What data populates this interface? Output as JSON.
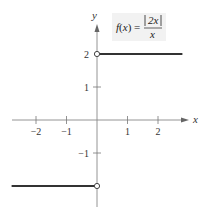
{
  "chart_data": {
    "type": "line",
    "function_label": {
      "lhs": "f(x) =",
      "numerator": "2x",
      "denominator": "x"
    },
    "xlabel": "x",
    "ylabel": "y",
    "xlim": [
      -2.8,
      2.9
    ],
    "ylim": [
      -2.6,
      3.1
    ],
    "x_ticks": [
      -2,
      -1,
      1,
      2
    ],
    "y_ticks": [
      -1,
      1,
      2
    ],
    "x_tick_labels": [
      "−2",
      "−1",
      "1",
      "2"
    ],
    "y_tick_labels": [
      "−1",
      "1",
      "2"
    ],
    "grid": false,
    "series": [
      {
        "name": "f(x) for x > 0",
        "x": [
          0,
          2.8
        ],
        "y": [
          2,
          2
        ],
        "left_endpoint": "open"
      },
      {
        "name": "f(x) for x < 0",
        "x": [
          -2.8,
          0
        ],
        "y": [
          -2,
          -2
        ],
        "right_endpoint": "open"
      }
    ],
    "open_points": [
      {
        "x": 0,
        "y": 2
      },
      {
        "x": 0,
        "y": -2
      }
    ]
  },
  "layout": {
    "origin_px": [
      97,
      120
    ],
    "x_unit_px": 30.5,
    "y_unit_px": 33,
    "colors": {
      "axis": "#888888",
      "curve": "#333333",
      "label_box": "#f2f2f2"
    }
  }
}
